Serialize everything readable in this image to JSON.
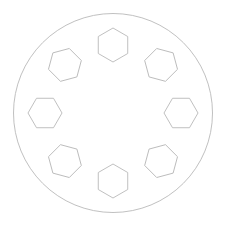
{
  "canvas": {
    "width": 225,
    "height": 228,
    "background_color": "#ffffff",
    "title": "Bolt circle with eight hexagonal holes"
  },
  "drawing": {
    "stroke_color": "#b9b9b9",
    "stroke_width": 0.9,
    "fill": "none",
    "outer_circle": {
      "name": "outer-boundary-circle",
      "center_x": 113,
      "center_y": 113,
      "radius": 99.5
    },
    "hole_pattern": {
      "shape": "hexagon",
      "count": 8,
      "bolt_circle_radius": 68,
      "hexagon_circumradius": 17,
      "angular_pitch_degrees": 45,
      "start_angle_degrees": -90,
      "rotation_follows_angle": true
    },
    "holes": [
      {
        "index": 1,
        "label": "hex-hole-top",
        "angle_degrees": -90,
        "center_x": 113.0,
        "center_y": 45.0,
        "rotation_degrees": 0
      },
      {
        "index": 2,
        "label": "hex-hole-top-right",
        "angle_degrees": -45,
        "center_x": 161.1,
        "center_y": 64.9,
        "rotation_degrees": 45
      },
      {
        "index": 3,
        "label": "hex-hole-right",
        "angle_degrees": 0,
        "center_x": 181.0,
        "center_y": 113.0,
        "rotation_degrees": 90
      },
      {
        "index": 4,
        "label": "hex-hole-bottom-right",
        "angle_degrees": 45,
        "center_x": 161.1,
        "center_y": 161.1,
        "rotation_degrees": 135
      },
      {
        "index": 5,
        "label": "hex-hole-bottom",
        "angle_degrees": 90,
        "center_x": 113.0,
        "center_y": 181.0,
        "rotation_degrees": 180
      },
      {
        "index": 6,
        "label": "hex-hole-bottom-left",
        "angle_degrees": 135,
        "center_x": 64.9,
        "center_y": 161.1,
        "rotation_degrees": 225
      },
      {
        "index": 7,
        "label": "hex-hole-left",
        "angle_degrees": 180,
        "center_x": 45.0,
        "center_y": 113.0,
        "rotation_degrees": 270
      },
      {
        "index": 8,
        "label": "hex-hole-top-left",
        "angle_degrees": 225,
        "center_x": 64.9,
        "center_y": 64.9,
        "rotation_degrees": 315
      }
    ]
  }
}
